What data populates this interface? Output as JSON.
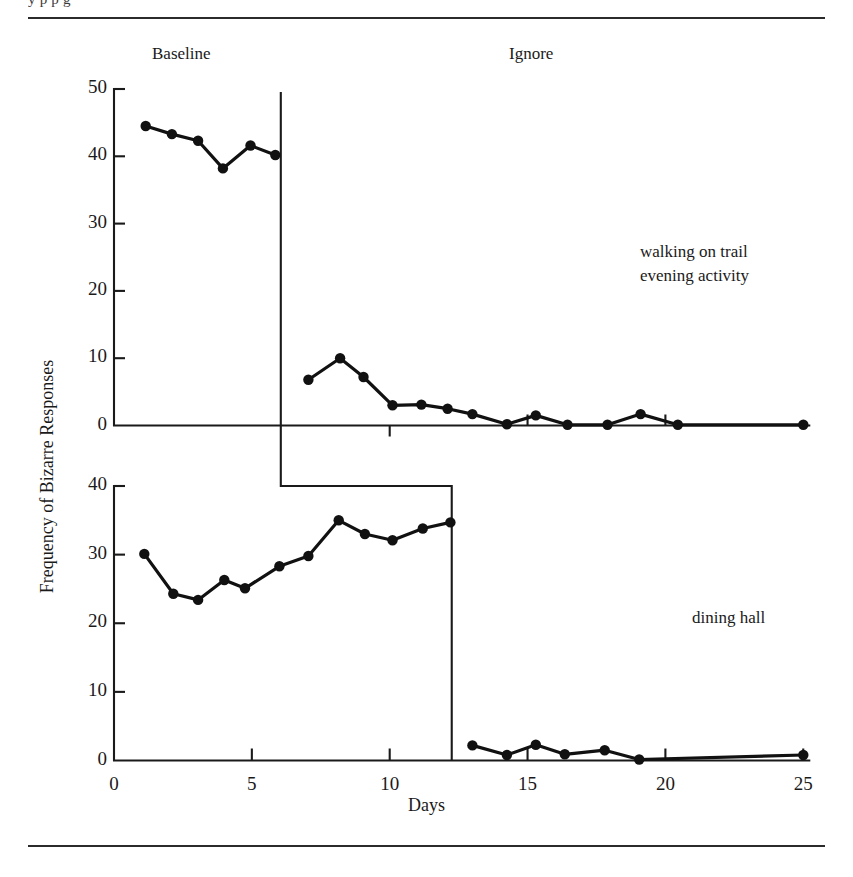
{
  "figure": {
    "clipped_running_head": "y                                                                                     p          p        g",
    "ylabel": "Frequency of Bizarre Responses",
    "xlabel": "Days",
    "phases": [
      {
        "name": "baseline",
        "label": "Baseline"
      },
      {
        "name": "ignore",
        "label": "Ignore"
      }
    ],
    "annotations": [
      {
        "name": "top-panel-annotation",
        "text": "walking on trail\nevening activity"
      },
      {
        "name": "bottom-panel-annotation",
        "text": "dining hall"
      }
    ]
  },
  "axes": {
    "x": {
      "label": "Days",
      "min": 0,
      "max": 25,
      "ticks": [
        0,
        5,
        10,
        15,
        20,
        25
      ],
      "tick_labels": [
        "0",
        "5",
        "10",
        "15",
        "20",
        "25"
      ]
    },
    "y_top": {
      "min": 0,
      "max": 50,
      "ticks": [
        0,
        10,
        20,
        30,
        40,
        50
      ],
      "tick_labels": [
        "0",
        "10",
        "20",
        "30",
        "40",
        "50"
      ]
    },
    "y_bottom": {
      "min": 0,
      "max": 40,
      "ticks": [
        0,
        10,
        20,
        30,
        40
      ],
      "tick_labels": [
        "0",
        "10",
        "20",
        "30",
        "40"
      ]
    }
  },
  "chart_data": {
    "type": "line",
    "title": "",
    "xlabel": "Days",
    "ylabel": "Frequency of Bizarre Responses",
    "grid": false,
    "legend": "none",
    "layout": "multiple-baseline, two stacked panels sharing one x-axis",
    "panels": [
      {
        "name": "walking-on-trail-evening-activity",
        "annotation": "walking on trail\nevening activity",
        "ylim": [
          0,
          50
        ],
        "yticks": [
          0,
          10,
          20,
          30,
          40,
          50
        ],
        "phase_change_day": 6.05,
        "series": [
          {
            "name": "Baseline",
            "x": [
              1.15,
              2.1,
              3.05,
              3.95,
              4.95,
              5.85
            ],
            "y": [
              44.5,
              43.3,
              42.3,
              38.2,
              41.6,
              40.2
            ]
          },
          {
            "name": "Ignore",
            "x": [
              7.05,
              8.2,
              9.05,
              10.1,
              11.15,
              12.1,
              13.0,
              14.25,
              15.3,
              16.45,
              17.9,
              19.1,
              20.45,
              25.0
            ],
            "y": [
              6.8,
              10.0,
              7.2,
              3.0,
              3.1,
              2.5,
              1.7,
              0.2,
              1.5,
              0.1,
              0.1,
              1.7,
              0.1,
              0.1
            ]
          }
        ]
      },
      {
        "name": "dining-hall",
        "annotation": "dining hall",
        "ylim": [
          0,
          40
        ],
        "yticks": [
          0,
          10,
          20,
          30,
          40
        ],
        "phase_change_day": 12.25,
        "series": [
          {
            "name": "Baseline",
            "x": [
              1.1,
              2.15,
              3.05,
              4.0,
              4.75,
              6.0,
              7.05,
              8.15,
              9.1,
              10.1,
              11.2,
              12.2
            ],
            "y": [
              30.1,
              24.3,
              23.4,
              26.3,
              25.1,
              28.3,
              29.8,
              35.0,
              33.0,
              32.1,
              33.8,
              34.7
            ]
          },
          {
            "name": "Ignore",
            "x": [
              13.0,
              14.25,
              15.3,
              16.35,
              17.8,
              19.05,
              25.0
            ],
            "y": [
              2.2,
              0.8,
              2.3,
              0.9,
              1.5,
              0.15,
              0.8
            ]
          }
        ]
      }
    ]
  }
}
